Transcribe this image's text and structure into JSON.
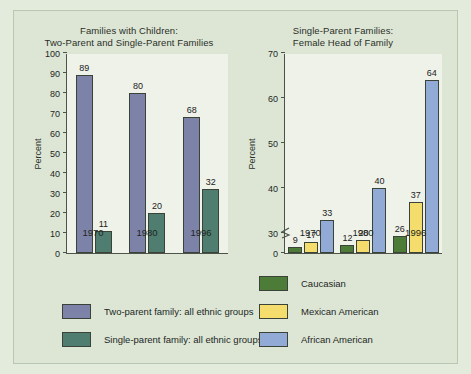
{
  "figure": {
    "background_color": "#e3ebdd",
    "panel_color": "#dde6d5",
    "plot_color": "#eef2e9"
  },
  "colors": {
    "two_parent": "#7d82a8",
    "single_parent": "#4f7e71",
    "caucasian": "#4c7c38",
    "mexican_american": "#f4dd6d",
    "african_american": "#92abd6",
    "axis": "#4c5349",
    "text": "#22261f"
  },
  "chart_data": [
    {
      "type": "bar",
      "id": "families-with-children",
      "title": "Families with Children:\nTwo-Parent and Single-Parent Families",
      "xlabel": "",
      "ylabel": "Percent",
      "ylim": [
        0,
        100
      ],
      "yticks": [
        0,
        10,
        20,
        30,
        40,
        50,
        60,
        70,
        80,
        90,
        100
      ],
      "ytick_labels": [
        "0",
        "10",
        "20",
        "30",
        "40",
        "50",
        "60",
        "70",
        "80",
        "90",
        "100"
      ],
      "axis_break": false,
      "grid": false,
      "legend_position": "bottom-left",
      "categories": [
        "1970",
        "1980",
        "1996"
      ],
      "series": [
        {
          "name": "Two-parent family: all ethnic groups",
          "color": "#7d82a8",
          "values": [
            89,
            80,
            68
          ]
        },
        {
          "name": "Single-parent family: all ethnic groups",
          "color": "#4f7e71",
          "values": [
            11,
            20,
            32
          ]
        }
      ]
    },
    {
      "type": "bar",
      "id": "single-parent-female-head",
      "title": "Single-Parent Families:\nFemale Head of Family",
      "xlabel": "",
      "ylabel": "Percent",
      "ylim": [
        0,
        70
      ],
      "yticks": [
        0,
        30,
        40,
        50,
        60,
        70
      ],
      "ytick_labels": [
        "0",
        "30",
        "40",
        "50",
        "60",
        "70"
      ],
      "axis_break": true,
      "axis_break_between": [
        0,
        30
      ],
      "grid": false,
      "legend_position": "bottom-right",
      "categories": [
        "1970",
        "1980",
        "1996"
      ],
      "series": [
        {
          "name": "Caucasian",
          "color": "#4c7c38",
          "values": [
            9,
            12,
            26
          ]
        },
        {
          "name": "Mexican American",
          "color": "#f4dd6d",
          "values": [
            17,
            20,
            37
          ]
        },
        {
          "name": "African American",
          "color": "#92abd6",
          "values": [
            33,
            40,
            64
          ]
        }
      ]
    }
  ],
  "legend_left": [
    {
      "label": "Two-parent family: all ethnic groups",
      "color": "#7d82a8"
    },
    {
      "label": "Single-parent family: all ethnic groups",
      "color": "#4f7e71"
    }
  ],
  "legend_right": [
    {
      "label": "Caucasian",
      "color": "#4c7c38"
    },
    {
      "label": "Mexican American",
      "color": "#f4dd6d"
    },
    {
      "label": "African American",
      "color": "#92abd6"
    }
  ]
}
